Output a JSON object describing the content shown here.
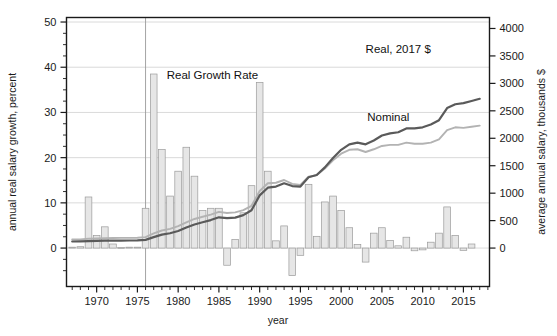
{
  "chart_data": {
    "type": "bar",
    "title": "",
    "subtitle": "",
    "xlabel": "year",
    "ylabel": "annual real salary growth, percent",
    "ylabel_right": "average annual salary, thousands $",
    "xlim": [
      1966.3,
      2018.2
    ],
    "ylim": [
      -8.5,
      51.0
    ],
    "ylim_right": [
      -700,
      4200
    ],
    "yticks": [
      0,
      10,
      20,
      30,
      40,
      50
    ],
    "ytick_labels": [
      "0",
      "10",
      "20",
      "30",
      "40",
      "50"
    ],
    "yticks_right": [
      0,
      500,
      1000,
      1500,
      2000,
      2500,
      3000,
      3500,
      4000
    ],
    "ytick_labels_right": [
      "0",
      "500",
      "1000",
      "1500",
      "2000",
      "2500",
      "3000",
      "3500",
      "4000"
    ],
    "xticks": [
      1970,
      1975,
      1980,
      1985,
      1990,
      1995,
      2000,
      2005,
      2010,
      2015
    ],
    "xtick_labels": [
      "1970",
      "1975",
      "1980",
      "1985",
      "1990",
      "1995",
      "2000",
      "2005",
      "2010",
      "2015"
    ],
    "xtick_minor_step": 1,
    "grid": "horizontal-major",
    "legend_position": "inline-annotations",
    "annotations": [
      {
        "text": "Real Growth Rate",
        "x": 1978.6,
        "y": 37.5,
        "anchor": "start"
      },
      {
        "text": "Real, 2017 $",
        "x": 2003.0,
        "y": 43.2,
        "anchor": "start"
      },
      {
        "text": "Nominal",
        "x": 2003.2,
        "y": 28.0,
        "anchor": "start"
      }
    ],
    "vertical_reference_line": {
      "x": 1976.0,
      "color": "#9a9a9a"
    },
    "series": [
      {
        "name": "Real Growth Rate",
        "type": "bar",
        "axis": "left",
        "unit": "percent",
        "color": "#e6e6e6",
        "edge_color": "#9b9b9b",
        "x": [
          1967,
          1968,
          1969,
          1970,
          1971,
          1972,
          1973,
          1974,
          1975,
          1976,
          1977,
          1978,
          1979,
          1980,
          1981,
          1982,
          1983,
          1984,
          1985,
          1986,
          1987,
          1988,
          1989,
          1990,
          1991,
          1992,
          1993,
          1994,
          1995,
          1996,
          1997,
          1998,
          1999,
          2000,
          2001,
          2002,
          2003,
          2004,
          2005,
          2006,
          2007,
          2008,
          2009,
          2010,
          2011,
          2012,
          2013,
          2014,
          2015,
          2016,
          2017
        ],
        "values": [
          0.2,
          0.3,
          11.3,
          2.8,
          4.7,
          0.9,
          0.1,
          0.2,
          0.2,
          8.8,
          38.5,
          21.8,
          11.5,
          17.0,
          22.3,
          15.9,
          8.3,
          8.8,
          8.8,
          -3.8,
          1.9,
          7.8,
          13.8,
          36.6,
          17.0,
          1.6,
          4.9,
          -6.1,
          -1.6,
          14.1,
          2.6,
          10.2,
          11.5,
          8.3,
          4.5,
          0.8,
          -3.1,
          3.3,
          4.5,
          1.7,
          0.5,
          2.4,
          -0.6,
          -0.4,
          1.3,
          3.3,
          9.1,
          2.8,
          -0.5,
          0.9,
          0.0
        ]
      },
      {
        "name": "Real, 2017 $",
        "type": "line",
        "axis": "right",
        "unit": "thousands $",
        "color": "#b3b3b3",
        "x": [
          1967,
          1968,
          1969,
          1970,
          1971,
          1972,
          1973,
          1974,
          1975,
          1976,
          1977,
          1978,
          1979,
          1980,
          1981,
          1982,
          1983,
          1984,
          1985,
          1986,
          1987,
          1988,
          1989,
          1990,
          1991,
          1992,
          1993,
          1994,
          1995,
          1996,
          1997,
          1998,
          1999,
          2000,
          2001,
          2002,
          2003,
          2004,
          2005,
          2006,
          2007,
          2008,
          2009,
          2010,
          2011,
          2012,
          2013,
          2014,
          2015,
          2016,
          2017
        ],
        "values": [
          155,
          158,
          170,
          175,
          182,
          184,
          185,
          186,
          188,
          200,
          268,
          320,
          350,
          400,
          470,
          530,
          570,
          610,
          660,
          640,
          650,
          690,
          770,
          1040,
          1180,
          1190,
          1240,
          1170,
          1150,
          1300,
          1330,
          1450,
          1600,
          1720,
          1790,
          1800,
          1750,
          1800,
          1860,
          1880,
          1880,
          1920,
          1900,
          1900,
          1920,
          1980,
          2150,
          2200,
          2190,
          2210,
          2230
        ]
      },
      {
        "name": "Nominal",
        "type": "line",
        "axis": "right",
        "unit": "thousands $",
        "color": "#5a5a5a",
        "x": [
          1967,
          1968,
          1969,
          1970,
          1971,
          1972,
          1973,
          1974,
          1975,
          1976,
          1977,
          1978,
          1979,
          1980,
          1981,
          1982,
          1983,
          1984,
          1985,
          1986,
          1987,
          1988,
          1989,
          1990,
          1991,
          1992,
          1993,
          1994,
          1995,
          1996,
          1997,
          1998,
          1999,
          2000,
          2001,
          2002,
          2003,
          2004,
          2005,
          2006,
          2007,
          2008,
          2009,
          2010,
          2011,
          2012,
          2013,
          2014,
          2015,
          2016,
          2017
        ]
      }
    ]
  },
  "figure": {
    "background": "#ffffff",
    "plot_border_color": "#1a1a1a",
    "grid_color": "#d0d0d0"
  }
}
